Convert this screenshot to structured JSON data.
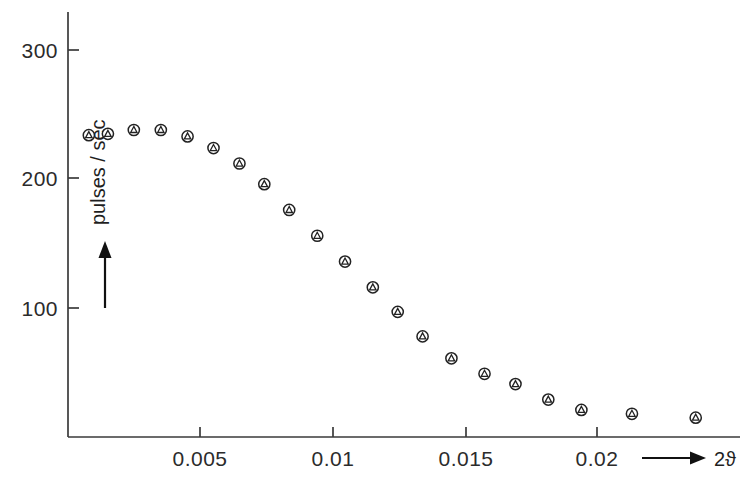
{
  "figure": {
    "title": "",
    "background": "#ffffff",
    "ink_color": "#222222"
  },
  "axes": {
    "y": {
      "label": "pulses / sec",
      "arrow": "up-arrow",
      "ticks": [
        {
          "value": 100,
          "label": "100"
        },
        {
          "value": 200,
          "label": "200"
        },
        {
          "value": 300,
          "label": "300"
        }
      ],
      "range": [
        0,
        330
      ]
    },
    "x": {
      "label": "2ϑ",
      "arrow": "right-arrow",
      "ticks": [
        {
          "value": 0.005,
          "label": "0.005"
        },
        {
          "value": 0.01,
          "label": "0.01"
        },
        {
          "value": 0.015,
          "label": "0.015"
        },
        {
          "value": 0.02,
          "label": "0.02"
        }
      ],
      "range": [
        0,
        0.0255
      ]
    }
  },
  "chart_data": {
    "type": "scatter",
    "title": "",
    "xlabel": "2ϑ",
    "ylabel": "pulses / sec",
    "xlim": [
      0,
      0.0255
    ],
    "ylim": [
      0,
      330
    ],
    "grid": false,
    "legend": "none",
    "marker": "circle-with-inscribed-triangle",
    "note": "Two nearly coincident datasets plotted with overlapping circle and triangle symbols",
    "series": [
      {
        "name": "intensity",
        "x": [
          0.0008,
          0.00152,
          0.0025,
          0.00352,
          0.00453,
          0.00551,
          0.00649,
          0.00743,
          0.00837,
          0.00943,
          0.01048,
          0.01153,
          0.01247,
          0.01341,
          0.0145,
          0.01575,
          0.01692,
          0.01816,
          0.01941,
          0.02132,
          0.02373
        ],
        "y": [
          234,
          235,
          238,
          238,
          233,
          224,
          212,
          196,
          176,
          156,
          136,
          116,
          97,
          78,
          61,
          49,
          41,
          29,
          21,
          18,
          15
        ]
      }
    ]
  }
}
